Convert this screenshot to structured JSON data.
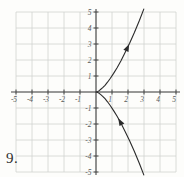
{
  "problem": {
    "number_label": "9."
  },
  "figure": {
    "bg_color": "#fdfdfb",
    "grid_color": "#d0d3d0",
    "axis_color": "#454545",
    "curve_color": "#2b2b2b",
    "tick_label_color": "#5a5a5a"
  },
  "chart_data": {
    "type": "line",
    "subtype": "parametric-curve",
    "curve_name": "semicubical parabola",
    "equation": "y^2 = x^3",
    "parametric": "x = t^2, y = t^3",
    "xlim": [
      -5,
      5
    ],
    "ylim": [
      -5,
      5
    ],
    "grid": true,
    "x_ticks": [
      -5,
      -4,
      -3,
      -2,
      -1,
      1,
      2,
      3,
      4,
      5
    ],
    "y_ticks": [
      -5,
      -4,
      -3,
      -2,
      -1,
      1,
      2,
      3,
      4,
      5
    ],
    "points": [
      [
        2.99,
        -5.18
      ],
      [
        2.72,
        -4.49
      ],
      [
        2.4,
        -3.72
      ],
      [
        2.1,
        -3.05
      ],
      [
        1.82,
        -2.46
      ],
      [
        1.56,
        -1.95
      ],
      [
        1.32,
        -1.52
      ],
      [
        1.1,
        -1.16
      ],
      [
        0.9,
        -0.86
      ],
      [
        0.72,
        -0.61
      ],
      [
        0.56,
        -0.42
      ],
      [
        0.42,
        -0.27
      ],
      [
        0.3,
        -0.17
      ],
      [
        0.2,
        -0.09
      ],
      [
        0.12,
        -0.04
      ],
      [
        0.06,
        -0.02
      ],
      [
        0.02,
        0.0
      ],
      [
        0.0,
        0.0
      ],
      [
        0.02,
        0.0
      ],
      [
        0.06,
        0.02
      ],
      [
        0.12,
        0.04
      ],
      [
        0.2,
        0.09
      ],
      [
        0.3,
        0.17
      ],
      [
        0.42,
        0.27
      ],
      [
        0.56,
        0.42
      ],
      [
        0.72,
        0.61
      ],
      [
        0.9,
        0.86
      ],
      [
        1.1,
        1.16
      ],
      [
        1.32,
        1.52
      ],
      [
        1.56,
        1.95
      ],
      [
        1.82,
        2.46
      ],
      [
        2.1,
        3.05
      ],
      [
        2.4,
        3.72
      ],
      [
        2.72,
        4.49
      ],
      [
        2.99,
        5.18
      ]
    ],
    "arrows": [
      {
        "x": 1.39,
        "y": -1.64,
        "dx": -2.4,
        "dy": 4.2,
        "direction": "toward origin (up-left along lower branch)"
      },
      {
        "x": 2.07,
        "y": 2.99,
        "dx": 2.9,
        "dy": 6.2,
        "direction": "away from origin (up-right along upper branch)"
      }
    ]
  }
}
